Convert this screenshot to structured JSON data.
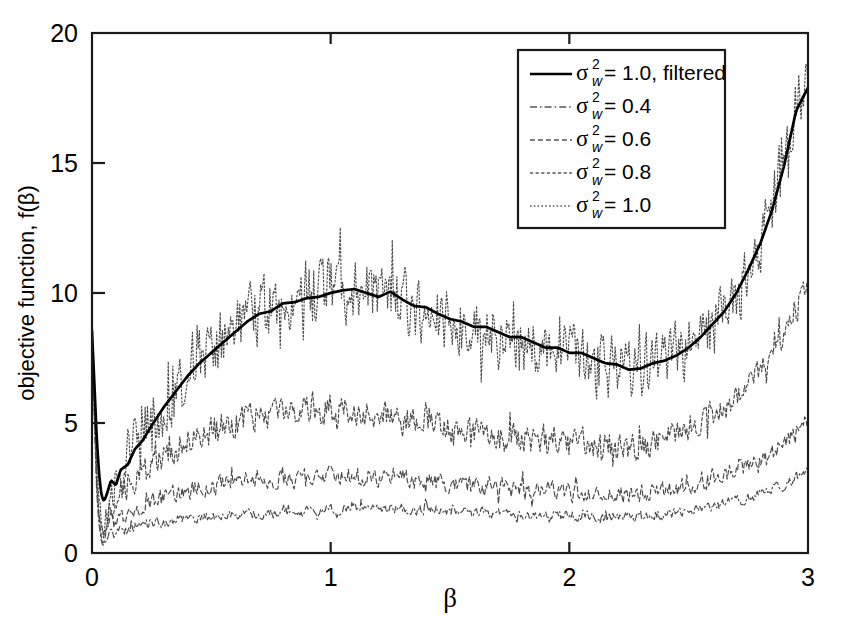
{
  "chart_data": {
    "type": "line",
    "title": "",
    "xlabel": "β",
    "ylabel": "objective function, f(β)",
    "xlim": [
      0,
      3
    ],
    "ylim": [
      0,
      20
    ],
    "xticks": [
      "0",
      "1",
      "2",
      "3"
    ],
    "yticks": [
      "0",
      "5",
      "10",
      "15",
      "20"
    ],
    "xtick_values": [
      0,
      1,
      2,
      3
    ],
    "ytick_values": [
      0,
      5,
      10,
      15,
      20
    ],
    "grid": false,
    "legend_position": "top-right",
    "legend_entries": [
      {
        "label": "σ²_w = 1.0, filtered",
        "style": "solid",
        "width": 2.6,
        "color": "#000000"
      },
      {
        "label": "σ²_w = 0.4",
        "style": "dashdot",
        "width": 1.1,
        "color": "#202020"
      },
      {
        "label": "σ²_w = 0.6",
        "style": "dashed",
        "width": 1.1,
        "color": "#303030"
      },
      {
        "label": "σ²_w = 0.8",
        "style": "densedash",
        "width": 1.1,
        "color": "#404040"
      },
      {
        "label": "σ²_w = 1.0",
        "style": "dotted",
        "width": 1.1,
        "color": "#555555"
      }
    ],
    "series": [
      {
        "name": "sigma2_w = 0.4",
        "style": "dashdot",
        "x": [
          0.0,
          0.01,
          0.02,
          0.03,
          0.04,
          0.05,
          0.06,
          0.08,
          0.1,
          0.12,
          0.15,
          0.18,
          0.21,
          0.25,
          0.3,
          0.35,
          0.4,
          0.45,
          0.5,
          0.55,
          0.6,
          0.65,
          0.7,
          0.75,
          0.8,
          0.85,
          0.9,
          0.95,
          1.0,
          1.05,
          1.1,
          1.15,
          1.2,
          1.25,
          1.3,
          1.35,
          1.4,
          1.45,
          1.5,
          1.55,
          1.6,
          1.65,
          1.7,
          1.75,
          1.8,
          1.85,
          1.9,
          1.95,
          2.0,
          2.05,
          2.1,
          2.15,
          2.2,
          2.25,
          2.3,
          2.35,
          2.4,
          2.45,
          2.5,
          2.55,
          2.6,
          2.65,
          2.7,
          2.75,
          2.8,
          2.85,
          2.9,
          2.95,
          3.0
        ],
        "y": [
          8.4,
          5.0,
          2.2,
          1.0,
          0.45,
          0.3,
          0.55,
          0.85,
          0.7,
          0.95,
          0.85,
          1.05,
          1.0,
          1.2,
          1.15,
          1.3,
          1.25,
          1.4,
          1.35,
          1.45,
          1.4,
          1.5,
          1.55,
          1.5,
          1.6,
          1.55,
          1.65,
          1.6,
          1.7,
          1.65,
          1.75,
          1.7,
          1.65,
          1.75,
          1.7,
          1.6,
          1.7,
          1.65,
          1.6,
          1.55,
          1.5,
          1.55,
          1.5,
          1.45,
          1.5,
          1.45,
          1.4,
          1.45,
          1.4,
          1.45,
          1.4,
          1.35,
          1.4,
          1.35,
          1.4,
          1.45,
          1.5,
          1.55,
          1.6,
          1.7,
          1.8,
          1.9,
          2.0,
          2.1,
          2.25,
          2.4,
          2.6,
          2.85,
          3.1
        ],
        "noise": 0.22
      },
      {
        "name": "sigma2_w = 0.6",
        "style": "dashed",
        "x": [
          0.0,
          0.01,
          0.02,
          0.03,
          0.04,
          0.05,
          0.06,
          0.08,
          0.1,
          0.12,
          0.15,
          0.18,
          0.21,
          0.25,
          0.3,
          0.35,
          0.4,
          0.45,
          0.5,
          0.55,
          0.6,
          0.65,
          0.7,
          0.75,
          0.8,
          0.85,
          0.9,
          0.95,
          1.0,
          1.05,
          1.1,
          1.15,
          1.2,
          1.25,
          1.3,
          1.35,
          1.4,
          1.45,
          1.5,
          1.55,
          1.6,
          1.65,
          1.7,
          1.75,
          1.8,
          1.85,
          1.9,
          1.95,
          2.0,
          2.05,
          2.1,
          2.15,
          2.2,
          2.25,
          2.3,
          2.35,
          2.4,
          2.45,
          2.5,
          2.55,
          2.6,
          2.65,
          2.7,
          2.75,
          2.8,
          2.85,
          2.9,
          2.95,
          3.0
        ],
        "y": [
          8.45,
          5.4,
          2.6,
          1.2,
          0.6,
          0.5,
          0.9,
          1.3,
          1.1,
          1.5,
          1.45,
          1.75,
          1.8,
          2.0,
          2.1,
          2.3,
          2.4,
          2.5,
          2.6,
          2.65,
          2.7,
          2.8,
          2.85,
          2.8,
          2.9,
          2.85,
          2.95,
          2.9,
          3.0,
          2.95,
          3.0,
          2.9,
          2.85,
          2.95,
          2.85,
          2.75,
          2.8,
          2.7,
          2.65,
          2.6,
          2.55,
          2.6,
          2.5,
          2.45,
          2.5,
          2.4,
          2.35,
          2.4,
          2.3,
          2.35,
          2.3,
          2.25,
          2.3,
          2.25,
          2.3,
          2.4,
          2.45,
          2.5,
          2.6,
          2.75,
          2.9,
          3.05,
          3.2,
          3.4,
          3.6,
          3.85,
          4.2,
          4.7,
          5.1
        ],
        "noise": 0.38
      },
      {
        "name": "sigma2_w = 0.8",
        "style": "densedash",
        "x": [
          0.0,
          0.01,
          0.02,
          0.03,
          0.04,
          0.05,
          0.06,
          0.08,
          0.1,
          0.12,
          0.15,
          0.18,
          0.21,
          0.25,
          0.3,
          0.35,
          0.4,
          0.45,
          0.5,
          0.55,
          0.6,
          0.65,
          0.7,
          0.75,
          0.8,
          0.85,
          0.9,
          0.95,
          1.0,
          1.05,
          1.1,
          1.15,
          1.2,
          1.25,
          1.3,
          1.35,
          1.4,
          1.45,
          1.5,
          1.55,
          1.6,
          1.65,
          1.7,
          1.75,
          1.8,
          1.85,
          1.9,
          1.95,
          2.0,
          2.05,
          2.1,
          2.15,
          2.2,
          2.25,
          2.3,
          2.35,
          2.4,
          2.45,
          2.5,
          2.55,
          2.6,
          2.65,
          2.7,
          2.75,
          2.8,
          2.85,
          2.9,
          2.95,
          3.0
        ],
        "y": [
          8.5,
          5.6,
          3.0,
          1.5,
          0.8,
          0.7,
          1.3,
          2.0,
          1.7,
          2.3,
          2.4,
          2.9,
          3.0,
          3.4,
          3.7,
          4.0,
          4.3,
          4.5,
          4.7,
          4.9,
          5.0,
          5.2,
          5.3,
          5.2,
          5.4,
          5.3,
          5.5,
          5.4,
          5.6,
          5.5,
          5.5,
          5.3,
          5.2,
          5.4,
          5.2,
          5.0,
          5.1,
          4.9,
          4.8,
          4.7,
          4.6,
          4.7,
          4.5,
          4.4,
          4.5,
          4.3,
          4.2,
          4.3,
          4.1,
          4.2,
          4.1,
          4.0,
          4.05,
          4.0,
          4.1,
          4.3,
          4.4,
          4.6,
          4.8,
          5.0,
          5.3,
          5.6,
          6.0,
          6.4,
          6.9,
          7.5,
          8.3,
          9.4,
          10.5
        ],
        "noise": 0.62
      },
      {
        "name": "sigma2_w = 1.0",
        "style": "dotted",
        "x": [
          0.0,
          0.01,
          0.02,
          0.03,
          0.04,
          0.05,
          0.06,
          0.08,
          0.1,
          0.12,
          0.15,
          0.18,
          0.21,
          0.25,
          0.3,
          0.35,
          0.4,
          0.45,
          0.5,
          0.55,
          0.6,
          0.65,
          0.7,
          0.75,
          0.8,
          0.85,
          0.9,
          0.95,
          1.0,
          1.05,
          1.1,
          1.15,
          1.2,
          1.25,
          1.3,
          1.35,
          1.4,
          1.45,
          1.5,
          1.55,
          1.6,
          1.65,
          1.7,
          1.75,
          1.8,
          1.85,
          1.9,
          1.95,
          2.0,
          2.05,
          2.1,
          2.15,
          2.2,
          2.25,
          2.3,
          2.35,
          2.4,
          2.45,
          2.5,
          2.55,
          2.6,
          2.65,
          2.7,
          2.75,
          2.8,
          2.85,
          2.9,
          2.95,
          3.0
        ],
        "y": [
          8.55,
          5.8,
          3.3,
          1.8,
          1.0,
          0.9,
          1.8,
          2.8,
          2.4,
          3.3,
          3.5,
          4.2,
          4.4,
          5.0,
          5.6,
          6.3,
          6.9,
          7.4,
          7.8,
          8.2,
          8.6,
          9.0,
          9.3,
          9.3,
          9.6,
          9.6,
          9.8,
          9.8,
          10.0,
          10.1,
          10.1,
          9.9,
          9.8,
          10.0,
          9.7,
          9.4,
          9.4,
          9.1,
          8.9,
          8.8,
          8.6,
          8.6,
          8.4,
          8.2,
          8.2,
          8.0,
          7.8,
          7.8,
          7.6,
          7.6,
          7.4,
          7.2,
          7.2,
          7.0,
          7.1,
          7.3,
          7.4,
          7.6,
          7.9,
          8.3,
          8.8,
          9.3,
          10.0,
          10.9,
          11.9,
          13.2,
          14.9,
          17.0,
          18.6
        ],
        "noise": 1.35
      },
      {
        "name": "sigma2_w = 1.0, filtered",
        "style": "solid",
        "x": [
          0.0,
          0.01,
          0.02,
          0.03,
          0.04,
          0.05,
          0.06,
          0.08,
          0.1,
          0.12,
          0.15,
          0.18,
          0.21,
          0.25,
          0.3,
          0.35,
          0.4,
          0.45,
          0.5,
          0.55,
          0.6,
          0.65,
          0.7,
          0.75,
          0.8,
          0.85,
          0.9,
          0.95,
          1.0,
          1.05,
          1.1,
          1.15,
          1.2,
          1.25,
          1.3,
          1.35,
          1.4,
          1.45,
          1.5,
          1.55,
          1.6,
          1.65,
          1.7,
          1.75,
          1.8,
          1.85,
          1.9,
          1.95,
          2.0,
          2.05,
          2.1,
          2.15,
          2.2,
          2.25,
          2.3,
          2.35,
          2.4,
          2.45,
          2.5,
          2.55,
          2.6,
          2.65,
          2.7,
          2.75,
          2.8,
          2.85,
          2.9,
          2.95,
          3.0
        ],
        "y": [
          8.55,
          6.5,
          4.4,
          3.0,
          2.2,
          2.0,
          2.2,
          2.8,
          2.6,
          3.2,
          3.4,
          4.0,
          4.3,
          4.9,
          5.6,
          6.2,
          6.8,
          7.3,
          7.7,
          8.1,
          8.5,
          8.9,
          9.2,
          9.3,
          9.6,
          9.65,
          9.8,
          9.85,
          10.0,
          10.1,
          10.15,
          10.0,
          9.85,
          10.05,
          9.75,
          9.5,
          9.45,
          9.2,
          9.0,
          8.9,
          8.7,
          8.7,
          8.5,
          8.3,
          8.3,
          8.1,
          7.9,
          7.9,
          7.7,
          7.7,
          7.5,
          7.3,
          7.25,
          7.05,
          7.1,
          7.3,
          7.4,
          7.6,
          7.9,
          8.3,
          8.8,
          9.3,
          10.0,
          10.9,
          11.9,
          13.2,
          14.9,
          17.0,
          17.9
        ],
        "noise": 0.0
      }
    ]
  },
  "axes": {
    "x_tick_labels": [
      "0",
      "1",
      "2",
      "3"
    ],
    "y_tick_labels": [
      "0",
      "5",
      "10",
      "15",
      "20"
    ],
    "x_axis_title": "β",
    "y_axis_title": "objective function, f(β)"
  },
  "legend": {
    "items": [
      {
        "sigma": "σ",
        "sup": "2",
        "sub": "w",
        "value": "= 1.0, filtered",
        "style": "solid"
      },
      {
        "sigma": "σ",
        "sup": "2",
        "sub": "w",
        "value": "= 0.4",
        "style": "dashdot"
      },
      {
        "sigma": "σ",
        "sup": "2",
        "sub": "w",
        "value": "= 0.6",
        "style": "dashed"
      },
      {
        "sigma": "σ",
        "sup": "2",
        "sub": "w",
        "value": "= 0.8",
        "style": "densedash"
      },
      {
        "sigma": "σ",
        "sup": "2",
        "sub": "w",
        "value": "= 1.0",
        "style": "dotted"
      }
    ]
  },
  "colors": {
    "axis": "#000000",
    "background": "#ffffff",
    "curve_solid": "#000000",
    "curve_noisy": "#4a4a4a"
  }
}
